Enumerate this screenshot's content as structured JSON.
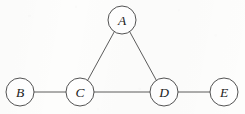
{
  "figure": {
    "width": 245,
    "height": 114,
    "background_color": "#fdfdfc",
    "stroke_color": "#4a4a4a",
    "node_fill_color": "#ffffff",
    "label_color": "#1d1d1d"
  },
  "graph": {
    "type": "undirected-graph",
    "node_radius": 14,
    "nodes": [
      {
        "id": "A",
        "label": "A",
        "cx": 122,
        "cy": 20
      },
      {
        "id": "B",
        "label": "B",
        "cx": 20,
        "cy": 92
      },
      {
        "id": "C",
        "label": "C",
        "cx": 80,
        "cy": 92
      },
      {
        "id": "D",
        "label": "D",
        "cx": 164,
        "cy": 92
      },
      {
        "id": "E",
        "label": "E",
        "cx": 224,
        "cy": 92
      }
    ],
    "edges": [
      {
        "id": "edge-a-c",
        "from": "A",
        "to": "C",
        "x1": 114.3,
        "y1": 31.7,
        "x2": 87.7,
        "y2": 80.3
      },
      {
        "id": "edge-a-d",
        "from": "A",
        "to": "D",
        "x1": 129.7,
        "y1": 31.7,
        "x2": 156.3,
        "y2": 80.3
      },
      {
        "id": "edge-b-c",
        "from": "B",
        "to": "C",
        "x1": 34,
        "y1": 92,
        "x2": 66,
        "y2": 92
      },
      {
        "id": "edge-c-d",
        "from": "C",
        "to": "D",
        "x1": 94,
        "y1": 92,
        "x2": 150,
        "y2": 92
      },
      {
        "id": "edge-d-e",
        "from": "D",
        "to": "E",
        "x1": 178,
        "y1": 92,
        "x2": 210,
        "y2": 92
      }
    ]
  }
}
